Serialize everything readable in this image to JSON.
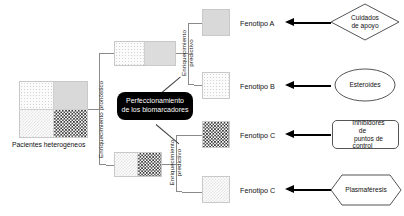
{
  "diagram": {
    "title_alt": "Enriquecimiento pronostico y predictivo de fenotipos",
    "source_block": {
      "label": "Pacientes heterogéneos",
      "quadrants": [
        {
          "name": "top-left",
          "pattern": "light-dotted"
        },
        {
          "name": "top-right",
          "pattern": "solid-gray"
        },
        {
          "name": "bottom-left",
          "pattern": "light-checker"
        },
        {
          "name": "bottom-right",
          "pattern": "dark-checker"
        }
      ]
    },
    "stage1_label": "Enriquecimiento pronóstico",
    "stage2_label_upper": "Enriquecimiento predictivo",
    "stage2_label_lower": "Enriquecimiento predictivo",
    "callout": {
      "line1": "Perfeccionamiento",
      "line2": "de los biomarcadores"
    },
    "intermediate_blocks": [
      {
        "name": "prognostic-group-upper",
        "left_pattern": "light-dotted",
        "right_pattern": "solid-gray"
      },
      {
        "name": "prognostic-group-lower",
        "left_pattern": "light-checker",
        "right_pattern": "dark-checker"
      }
    ],
    "rows": [
      {
        "phenotype": "Fenotipo A",
        "block_pattern": "solid-gray",
        "treatment": "Cuidados de apoyo",
        "treatment_lines": [
          "Cuidados",
          "de apoyo"
        ],
        "shape": "diamond"
      },
      {
        "phenotype": "Fenotipo B",
        "block_pattern": "light-dotted",
        "treatment": "Esteroides",
        "treatment_lines": [
          "Esteroides"
        ],
        "shape": "ellipse"
      },
      {
        "phenotype": "Fenotipo C",
        "block_pattern": "dark-checker",
        "treatment": "Inhibidores de puntos de control",
        "treatment_lines": [
          "Inhibidores de",
          "puntos de control"
        ],
        "shape": "rounded-rect"
      },
      {
        "phenotype": "Fenotipo C",
        "block_pattern": "light-checker",
        "treatment": "Plasmaféresis",
        "treatment_lines": [
          "Plasmaféresis"
        ],
        "shape": "hexagon"
      }
    ],
    "colors": {
      "line": "#8a8a8a",
      "arrow": "#000000",
      "callout_bg": "#000000",
      "callout_text": "#ffffff",
      "shape_border": "#555555"
    }
  }
}
